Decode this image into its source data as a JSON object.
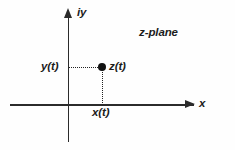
{
  "figure": {
    "plane_label": "z-plane",
    "axes": {
      "vertical_label": "iy",
      "horizontal_label": "x"
    },
    "point": {
      "label": "z(t)",
      "real_projection_label": "x(t)",
      "imag_projection_label": "y(t)"
    },
    "colors": {
      "axis": "#2b2b2b",
      "dotted": "#222222",
      "point": "#111111",
      "text": "#1c1c1c",
      "background": "#fefefe"
    }
  },
  "chart_data": {
    "type": "scatter",
    "title": "z-plane",
    "xlabel": "x",
    "ylabel": "iy",
    "grid": false,
    "legend": null,
    "xlim": [
      -1.75,
      3.4
    ],
    "ylim": [
      -1.0,
      2.5
    ],
    "points": [
      {
        "label": "z(t)",
        "x": 0.95,
        "y": 1.05
      }
    ],
    "annotations": [
      {
        "text": "z-plane",
        "x": 2.0,
        "y": 2.2
      },
      {
        "text": "y(t)",
        "x": -0.75,
        "y": 1.05
      },
      {
        "text": "x(t)",
        "x": 0.7,
        "y": -0.2
      },
      {
        "text": "z(t)",
        "x": 1.2,
        "y": 1.25
      }
    ],
    "guides": [
      {
        "type": "dotted-horizontal",
        "from": [
          0,
          1.05
        ],
        "to": [
          0.95,
          1.05
        ]
      },
      {
        "type": "dotted-vertical",
        "from": [
          0.95,
          1.05
        ],
        "to": [
          0.95,
          0
        ]
      }
    ]
  }
}
